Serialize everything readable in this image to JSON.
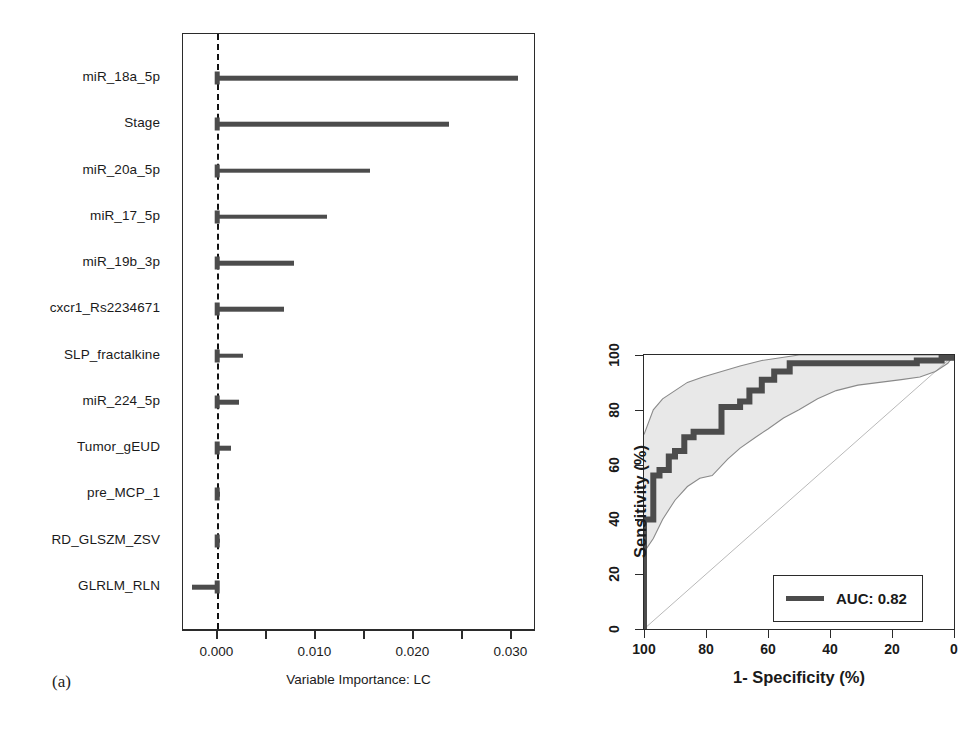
{
  "figure": {
    "panels": [
      {
        "letter": "(a)"
      },
      {
        "letter": "(b)"
      }
    ]
  },
  "panel_a": {
    "letter": "(a)",
    "axis_title": "Variable Importance: LC",
    "tick_labels": [
      "0.000",
      "0.010",
      "0.020",
      "0.030"
    ],
    "minor_ticks": [
      0.005,
      0.015,
      0.025
    ],
    "zero_reference_line": 0.0
  },
  "panel_b": {
    "letter": "(b)",
    "xlabel": "1- Specificity (%)",
    "ylabel": "Sensitivity (%)",
    "xticks": [
      "100",
      "80",
      "60",
      "40",
      "20",
      "0"
    ],
    "yticks": [
      "0",
      "20",
      "40",
      "60",
      "80",
      "100"
    ],
    "legend": {
      "label": "AUC: 0.82",
      "line_color": "#4c4c4c"
    }
  },
  "chart_data": [
    {
      "type": "bar",
      "orientation": "horizontal",
      "title": "",
      "xlabel": "Variable Importance: LC",
      "ylabel": "",
      "xlim": [
        -0.0035,
        0.0325
      ],
      "xticks": [
        0.0,
        0.005,
        0.01,
        0.015,
        0.02,
        0.025,
        0.03
      ],
      "xticklabels": [
        "0.000",
        "",
        "0.010",
        "",
        "0.020",
        "",
        "0.030"
      ],
      "grid": false,
      "reference_line": 0.0,
      "bar_color": "#4c4c4c",
      "categories": [
        "miR_18a_5p",
        "Stage",
        "miR_20a_5p",
        "miR_17_5p",
        "miR_19b_3p",
        "cxcr1_Rs2234671",
        "SLP_fractalkine",
        "miR_224_5p",
        "Tumor_gEUD",
        "pre_MCP_1",
        "RD_GLSZM_ZSV",
        "GLRLM_RLN"
      ],
      "values": [
        0.0307,
        0.0236,
        0.0156,
        0.0112,
        0.0078,
        0.0068,
        0.0026,
        0.0022,
        0.0014,
        0.0003,
        0.0003,
        -0.0026
      ]
    },
    {
      "type": "line",
      "subtype": "roc",
      "title": "",
      "xlabel": "1- Specificity (%)",
      "ylabel": "Sensitivity (%)",
      "xlim": [
        100,
        0
      ],
      "ylim": [
        0,
        100
      ],
      "xticks": [
        100,
        80,
        60,
        40,
        20,
        0
      ],
      "yticks": [
        0,
        20,
        40,
        60,
        80,
        100
      ],
      "x_axis_reversed": true,
      "grid": false,
      "legend_position": "bottom-right",
      "auc": 0.82,
      "series": [
        {
          "name": "AUC: 0.82",
          "kind": "step",
          "color": "#4c4c4c",
          "points": [
            [
              100,
              0
            ],
            [
              100,
              40
            ],
            [
              97,
              40
            ],
            [
              97,
              56
            ],
            [
              95,
              56
            ],
            [
              95,
              58
            ],
            [
              92,
              58
            ],
            [
              92,
              63
            ],
            [
              90,
              63
            ],
            [
              90,
              65
            ],
            [
              87,
              65
            ],
            [
              87,
              70
            ],
            [
              84,
              70
            ],
            [
              84,
              72
            ],
            [
              75,
              72
            ],
            [
              75,
              81
            ],
            [
              69,
              81
            ],
            [
              69,
              83
            ],
            [
              66,
              83
            ],
            [
              66,
              87
            ],
            [
              62,
              87
            ],
            [
              62,
              91
            ],
            [
              58,
              91
            ],
            [
              58,
              94
            ],
            [
              53,
              94
            ],
            [
              53,
              97
            ],
            [
              12,
              97
            ],
            [
              12,
              98
            ],
            [
              4,
              98
            ],
            [
              4,
              99
            ],
            [
              0,
              99
            ],
            [
              0,
              100
            ]
          ]
        },
        {
          "name": "confidence-band-upper",
          "kind": "line",
          "color": "#8a8a8a",
          "points": [
            [
              100,
              71
            ],
            [
              97,
              80
            ],
            [
              94,
              84
            ],
            [
              90,
              87
            ],
            [
              86,
              90
            ],
            [
              81,
              92
            ],
            [
              75,
              94
            ],
            [
              69,
              96
            ],
            [
              62,
              98
            ],
            [
              56,
              99
            ],
            [
              50,
              100
            ],
            [
              30,
              100
            ],
            [
              10,
              100
            ],
            [
              0,
              100
            ]
          ]
        },
        {
          "name": "confidence-band-lower",
          "kind": "line",
          "color": "#8a8a8a",
          "points": [
            [
              100,
              28
            ],
            [
              97,
              33
            ],
            [
              94,
              40
            ],
            [
              90,
              47
            ],
            [
              86,
              52
            ],
            [
              82,
              55
            ],
            [
              78,
              56
            ],
            [
              73,
              62
            ],
            [
              69,
              66
            ],
            [
              64,
              70
            ],
            [
              60,
              73
            ],
            [
              55,
              77
            ],
            [
              50,
              80
            ],
            [
              44,
              84
            ],
            [
              38,
              87
            ],
            [
              31,
              89
            ],
            [
              24,
              90
            ],
            [
              17,
              91
            ],
            [
              11,
              92
            ],
            [
              6,
              94
            ],
            [
              2,
              97
            ],
            [
              0,
              100
            ]
          ]
        },
        {
          "name": "chance-diagonal",
          "kind": "line",
          "color": "#b9b9b9",
          "points": [
            [
              100,
              0
            ],
            [
              0,
              100
            ]
          ]
        }
      ],
      "band_fill_color": "#e8e8e8"
    }
  ]
}
